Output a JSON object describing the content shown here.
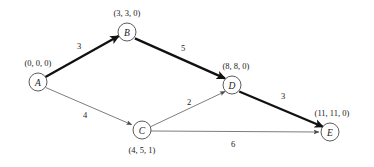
{
  "diagram": {
    "type": "directed-weighted-graph",
    "background_color": "#ffffff",
    "thin_edge_color": "#6e6e6e",
    "thick_edge_color": "#111111",
    "node_stroke_color": "#4a4a4a",
    "node_fill_color": "#ffffff",
    "text_color": "#1a1a1a",
    "nodes": [
      {
        "id": "A",
        "label": "A",
        "tuple": "(0, 0, 0)",
        "cx": 38,
        "cy": 82,
        "r": 9,
        "tuple_x": 38,
        "tuple_y": 63
      },
      {
        "id": "B",
        "label": "B",
        "tuple": "(3, 3, 0)",
        "cx": 127,
        "cy": 32,
        "r": 9,
        "tuple_x": 127,
        "tuple_y": 13
      },
      {
        "id": "C",
        "label": "C",
        "tuple": "(4, 5, 1)",
        "cx": 142,
        "cy": 130,
        "r": 9,
        "tuple_x": 142,
        "tuple_y": 150
      },
      {
        "id": "D",
        "label": "D",
        "tuple": "(8, 8, 0)",
        "cx": 232,
        "cy": 85,
        "r": 9,
        "tuple_x": 236,
        "tuple_y": 66
      },
      {
        "id": "E",
        "label": "E",
        "tuple": "(11, 11, 0)",
        "cx": 330,
        "cy": 132,
        "r": 9,
        "tuple_x": 332,
        "tuple_y": 113
      }
    ],
    "edges": [
      {
        "from": "A",
        "to": "B",
        "weight": "3",
        "critical": true,
        "label_x": 79,
        "label_y": 46
      },
      {
        "from": "B",
        "to": "D",
        "weight": "5",
        "critical": true,
        "label_x": 183,
        "label_y": 48
      },
      {
        "from": "D",
        "to": "E",
        "weight": "3",
        "critical": true,
        "label_x": 283,
        "label_y": 96
      },
      {
        "from": "A",
        "to": "C",
        "weight": "4",
        "critical": false,
        "label_x": 85,
        "label_y": 115
      },
      {
        "from": "C",
        "to": "D",
        "weight": "2",
        "critical": false,
        "label_x": 189,
        "label_y": 102
      },
      {
        "from": "C",
        "to": "E",
        "weight": "6",
        "critical": false,
        "label_x": 233,
        "label_y": 144
      }
    ]
  }
}
